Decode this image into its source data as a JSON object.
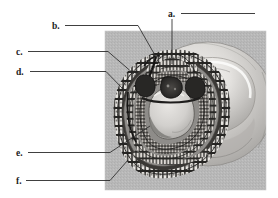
{
  "figure": {
    "background_color": "#ffffff",
    "panel": {
      "name": "micrograph-panel",
      "x": 105,
      "y": 31,
      "width": 161,
      "height": 159,
      "base_color": "#b9b9b9",
      "description": "Grayscale micrograph of a circular embryonic cross-section showing concentric rings of cells surrounding a central cavity, set against a larger pale rounded body at upper right."
    },
    "labels": [
      {
        "id": "a",
        "text": "a.",
        "text_x": 168,
        "text_y": 17,
        "rule": {
          "x1": 181,
          "y1": 13.5,
          "x2": 255,
          "y2": 13.5
        },
        "leader": "M 172,19 L 172,30 L 172,64",
        "target": "dorsal-midline-ectoderm-crest",
        "target_point": [
          172,
          64
        ]
      },
      {
        "id": "b",
        "text": "b.",
        "text_x": 52,
        "text_y": 29,
        "rule": {
          "x1": 65,
          "y1": 25.5,
          "x2": 138,
          "y2": 25.5
        },
        "leader": "M 138,25.5 L 156,57",
        "target": "neural-groove-notch",
        "target_point": [
          156,
          57
        ]
      },
      {
        "id": "c",
        "text": "c.",
        "text_x": 16,
        "text_y": 55,
        "rule": {
          "x1": 28,
          "y1": 51.5,
          "x2": 108,
          "y2": 51.5
        },
        "leader": "M 108,51.5 L 134,74",
        "target": "outer-epithelial-cell-layer",
        "target_point": [
          134,
          74
        ]
      },
      {
        "id": "d",
        "text": "d.",
        "text_x": 16,
        "text_y": 75,
        "rule": {
          "x1": 30,
          "y1": 71.5,
          "x2": 106,
          "y2": 71.5
        },
        "leader": "M 106,71.5 L 124,90",
        "target": "inner-mesodermal-band",
        "target_point": [
          124,
          90
        ]
      },
      {
        "id": "e",
        "text": "e.",
        "text_x": 16,
        "text_y": 156,
        "rule": {
          "x1": 28,
          "y1": 152.5,
          "x2": 110,
          "y2": 152.5
        },
        "leader": "M 110,152.5 L 150,126",
        "target": "central-cavity-lumen",
        "target_point": [
          150,
          126
        ]
      },
      {
        "id": "f",
        "text": "f.",
        "text_x": 16,
        "text_y": 184,
        "rule": {
          "x1": 26,
          "y1": 180.5,
          "x2": 110,
          "y2": 180.5
        },
        "leader": "M 110,180.5 L 128,160",
        "target": "outermost-peripheral-ring",
        "target_point": [
          128,
          160
        ]
      }
    ]
  }
}
